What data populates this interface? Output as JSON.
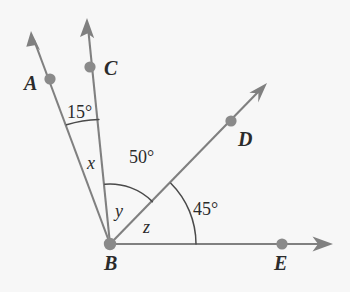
{
  "figure": {
    "background_color": "#f7f7f7",
    "line_color": "#808080",
    "arc_color": "#4a4a4a",
    "dot_color": "#8a8a8a",
    "text_color": "#2b2b2b",
    "vertex": {
      "name": "B",
      "x": 110,
      "y": 244
    },
    "points": [
      {
        "id": "A",
        "label": "A",
        "dot_x": 50,
        "dot_y": 79,
        "label_x": 24,
        "label_y": 90,
        "tip_x": 31,
        "tip_y": 32
      },
      {
        "id": "C",
        "label": "C",
        "dot_x": 90,
        "dot_y": 67,
        "label_x": 104,
        "label_y": 75,
        "tip_x": 87,
        "tip_y": 19
      },
      {
        "id": "D",
        "label": "D",
        "dot_x": 231,
        "dot_y": 121,
        "label_x": 238,
        "label_y": 146,
        "tip_x": 266,
        "tip_y": 84
      },
      {
        "id": "E",
        "label": "E",
        "dot_x": 282,
        "dot_y": 244,
        "label_x": 274,
        "label_y": 270,
        "tip_x": 332,
        "tip_y": 244
      }
    ],
    "angle_labels": [
      {
        "id": "angle-abc",
        "text": "15°",
        "x": 67,
        "y": 118,
        "kind": "measure"
      },
      {
        "id": "angle-cbd",
        "text": "50°",
        "x": 129,
        "y": 163,
        "kind": "measure"
      },
      {
        "id": "angle-dbe",
        "text": "45°",
        "x": 193,
        "y": 215,
        "kind": "measure"
      },
      {
        "id": "angle-x",
        "text": "x",
        "x": 87,
        "y": 169,
        "kind": "variable"
      },
      {
        "id": "angle-y",
        "text": "y",
        "x": 115,
        "y": 217,
        "kind": "variable"
      },
      {
        "id": "angle-z",
        "text": "z",
        "x": 143,
        "y": 233,
        "kind": "variable"
      }
    ],
    "arcs": [
      {
        "id": "arc-15",
        "from_ray": "A",
        "to_ray": "C",
        "radius": 127
      },
      {
        "id": "arc-50",
        "from_ray": "C",
        "to_ray": "D",
        "radius": 60
      },
      {
        "id": "arc-45",
        "from_ray": "D",
        "to_ray": "E",
        "radius": 86
      }
    ],
    "rays": [
      {
        "id": "ray-ba",
        "through": "A",
        "angle_deg": 110
      },
      {
        "id": "ray-bc",
        "through": "C",
        "angle_deg": 95
      },
      {
        "id": "ray-bd",
        "through": "D",
        "angle_deg": 45
      },
      {
        "id": "ray-be",
        "through": "E",
        "angle_deg": 0
      }
    ]
  }
}
